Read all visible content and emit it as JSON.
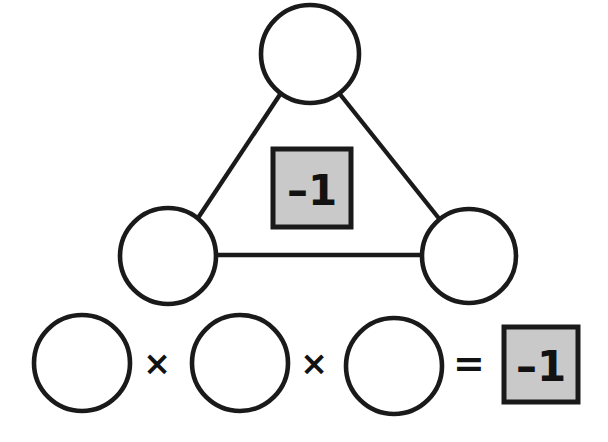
{
  "figure": {
    "background_color": "#ffffff",
    "stroke_color": "#1a1a1a",
    "box_fill_color": "#c9c9c9",
    "text_color": "#121212"
  },
  "triangle": {
    "center_box": {
      "label": "–1",
      "value": "-1"
    },
    "nodes": [
      {
        "id": "top",
        "label": "",
        "cx": 310,
        "cy": 54,
        "r": 49
      },
      {
        "id": "bottom-left",
        "label": "",
        "cx": 168,
        "cy": 256,
        "r": 48
      },
      {
        "id": "bottom-right",
        "label": "",
        "cx": 469,
        "cy": 256,
        "r": 47
      }
    ],
    "edges": [
      {
        "from": "top",
        "to": "bottom-left"
      },
      {
        "from": "top",
        "to": "bottom-right"
      },
      {
        "from": "bottom-left",
        "to": "bottom-right"
      }
    ]
  },
  "equation": {
    "terms": [
      {
        "id": "factor-1",
        "label": "",
        "cx": 82,
        "cy": 363,
        "r": 48
      },
      {
        "id": "factor-2",
        "label": "",
        "cx": 240,
        "cy": 363,
        "r": 48
      },
      {
        "id": "factor-3",
        "label": "",
        "cx": 394,
        "cy": 366,
        "r": 48
      }
    ],
    "operators": [
      {
        "id": "times-1",
        "symbol": "×",
        "name": "multiply"
      },
      {
        "id": "times-2",
        "symbol": "×",
        "name": "multiply"
      },
      {
        "id": "equals",
        "symbol": "=",
        "name": "equals"
      }
    ],
    "result_box": {
      "label": "–1",
      "value": "-1"
    }
  }
}
